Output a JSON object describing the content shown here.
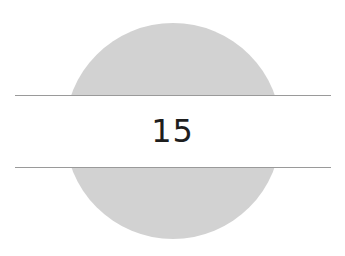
{
  "chapter": {
    "number": "15"
  },
  "colors": {
    "disc": "#d2d2d2",
    "rules": "#9a9a9a",
    "text": "#1e1e1e",
    "background": "#ffffff"
  }
}
